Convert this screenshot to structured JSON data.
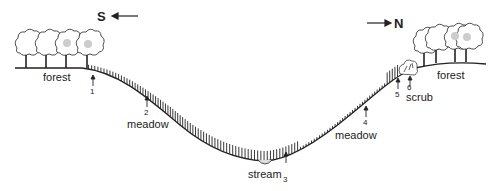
{
  "diagram": {
    "type": "transect-profile",
    "directions": {
      "left": "S",
      "right": "N"
    },
    "zones": [
      {
        "name": "forest",
        "side": "left"
      },
      {
        "name": "meadow",
        "side": "left-slope"
      },
      {
        "name": "stream",
        "side": "valley-bottom"
      },
      {
        "name": "meadow",
        "side": "right-slope"
      },
      {
        "name": "scrub",
        "side": "right-upper-slope"
      },
      {
        "name": "forest",
        "side": "right"
      }
    ],
    "sample_points": [
      "1",
      "2",
      "3",
      "4",
      "5",
      "6"
    ]
  },
  "labels": {
    "south": "S",
    "north": "N",
    "forest_left": "forest",
    "meadow_left": "meadow",
    "stream": "stream",
    "meadow_right": "meadow",
    "scrub": "scrub",
    "forest_right": "forest",
    "p1": "1",
    "p2": "2",
    "p3": "3",
    "p4": "4",
    "p5": "5",
    "p6": "6"
  },
  "colors": {
    "line": "#222222",
    "tree_shade": "#bbbbbb",
    "background": "#ffffff"
  }
}
